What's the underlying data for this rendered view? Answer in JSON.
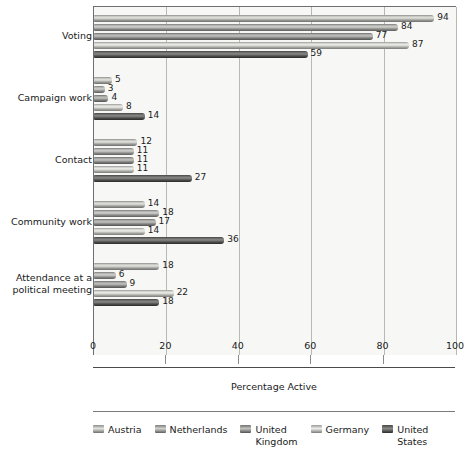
{
  "chart_data": {
    "type": "bar",
    "orientation": "horizontal",
    "title": "",
    "xlabel": "Percentage Active",
    "ylabel": "",
    "xlim": [
      0,
      100
    ],
    "xticks": [
      0,
      20,
      40,
      60,
      80,
      100
    ],
    "xtick_labels": [
      "0",
      "20",
      "40",
      "60",
      "80",
      "100"
    ],
    "grid": true,
    "grid_axis": "x",
    "legend_position": "bottom",
    "categories": [
      "Voting",
      "Campaign work",
      "Contact",
      "Community work",
      "Attendance at a\npolitical meeting"
    ],
    "series": [
      {
        "name": "Austria",
        "values": [
          94,
          5,
          12,
          14,
          18
        ]
      },
      {
        "name": "Netherlands",
        "values": [
          84,
          3,
          11,
          18,
          6
        ]
      },
      {
        "name": "United\nKingdom",
        "values": [
          77,
          4,
          11,
          17,
          9
        ]
      },
      {
        "name": "Germany",
        "values": [
          87,
          8,
          11,
          14,
          22
        ]
      },
      {
        "name": "United\nStates",
        "values": [
          59,
          14,
          27,
          36,
          18
        ]
      }
    ]
  },
  "legend": {
    "items": [
      {
        "label": "Austria"
      },
      {
        "label": "Netherlands"
      },
      {
        "label": "United\nKingdom"
      },
      {
        "label": "Germany"
      },
      {
        "label": "United\nStates"
      }
    ]
  },
  "colors": {
    "plot_background": "#f7f7f5",
    "gridline": "#b9b9b4",
    "axis": "#4a4a4a",
    "text": "#1a1a1a",
    "series": [
      "#b4b4b1",
      "#a4a4a1",
      "#979794",
      "#c4c4c1",
      "#595958"
    ]
  }
}
